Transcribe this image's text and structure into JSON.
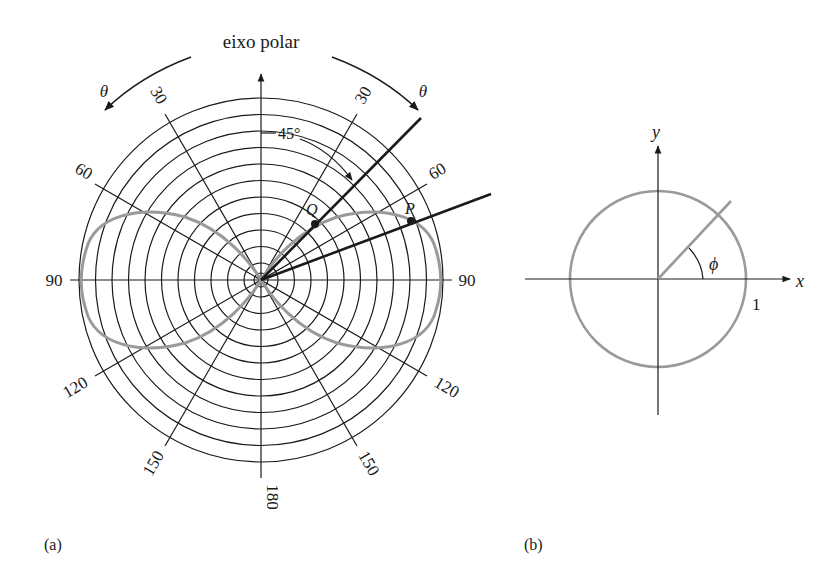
{
  "figure": {
    "panel_a": {
      "label": "(a)",
      "axis_title": "eixo polar",
      "theta_left": "θ",
      "theta_right": "θ",
      "angle_marker": "45°",
      "point_q": "Q",
      "point_p": "P",
      "tick_labels": {
        "left_30": "30",
        "right_30": "30",
        "left_60": "60",
        "right_60": "60",
        "left_90": "90",
        "right_90": "90",
        "left_120": "120",
        "right_120": "120",
        "left_150": "150",
        "right_150": "150",
        "bottom_180": "180"
      },
      "center": [
        261,
        280
      ],
      "outer_radius": 182,
      "ring_count": 11,
      "curve_color": "#9a9a9a",
      "grid_color": "#1a1a1a"
    },
    "panel_b": {
      "label": "(b)",
      "x_label": "x",
      "y_label": "y",
      "angle_label": "ϕ",
      "radius_label": "1",
      "center": [
        658,
        279
      ],
      "radius": 88,
      "circle_color": "#9a9a9a"
    }
  }
}
